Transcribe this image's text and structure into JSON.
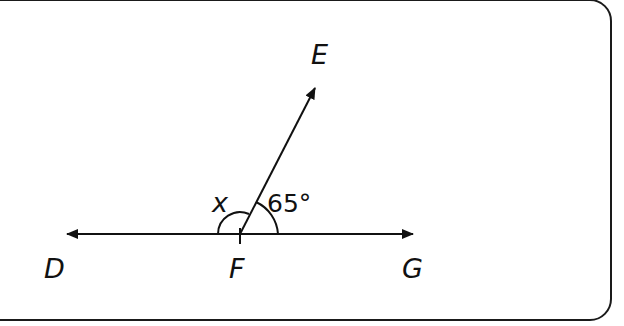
{
  "diagram": {
    "type": "geometry-angles",
    "points": {
      "D": {
        "label": "D",
        "x": 60,
        "y": 278
      },
      "F": {
        "label": "F",
        "x": 240,
        "y": 278
      },
      "G": {
        "label": "G",
        "x": 418,
        "y": 278
      },
      "E": {
        "label": "E",
        "x": 322,
        "y": 64
      }
    },
    "angles": {
      "x": {
        "label": "x",
        "between": [
          "D",
          "F",
          "E"
        ]
      },
      "efg": {
        "label": "65°",
        "between": [
          "E",
          "F",
          "G"
        ],
        "value_degrees": 65
      }
    },
    "colors": {
      "stroke": "#111111",
      "background": "#ffffff",
      "frame": "#1a1a1a"
    }
  }
}
